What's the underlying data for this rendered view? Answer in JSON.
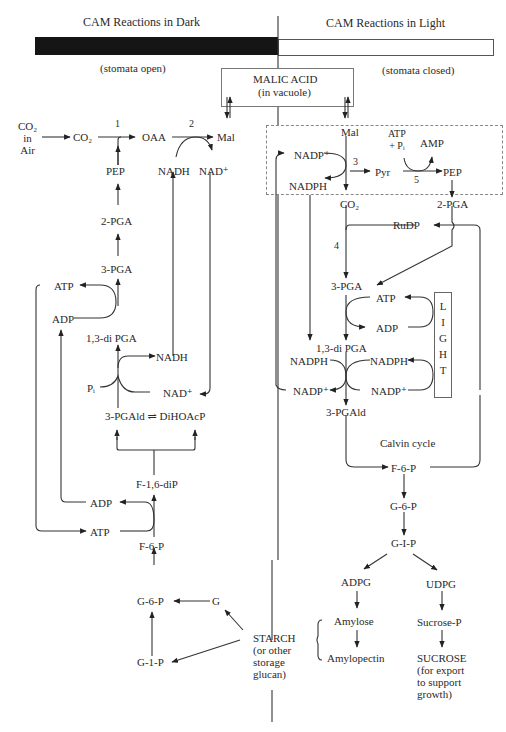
{
  "header": {
    "dark_title": "CAM Reactions in Dark",
    "light_title": "CAM Reactions in Light",
    "dark_note": "(stomata open)",
    "light_note": "(stomata closed)"
  },
  "vacuole": {
    "title": "MALIC ACID",
    "subtitle": "(in vacuole)"
  },
  "dark_pathway": {
    "co2_air": "CO₂\nin\nAir",
    "co2": "CO₂",
    "oaa": "OAA",
    "mal": "Mal",
    "step1": "1",
    "step2": "2",
    "pep": "PEP",
    "nadh_top": "NADH",
    "nad_top": "NAD⁺",
    "pga2": "2-PGA",
    "pga3": "3-PGA",
    "atp_upper": "ATP",
    "adp_upper": "ADP",
    "dipga": "1,3-di PGA",
    "nadh_mid": "NADH",
    "pi": "Pᵢ",
    "nad_mid": "NAD⁺",
    "pgald_eq": "3-PGAld ⇌ DiHOAcP",
    "f16dip": "F-1,6-diP",
    "adp_lower": "ADP",
    "atp_lower": "ATP",
    "f6p": "F-6-P",
    "g6p": "G-6-P",
    "g": "G",
    "g1p": "G-1-P",
    "starch": "STARCH\n(or other\nstorage\nglucan)"
  },
  "light_pathway": {
    "mal": "Mal",
    "atp_pi": "ATP\n+ Pᵢ",
    "amp": "AMP",
    "nadp_top": "NADP⁺",
    "nadph_top": "NADPH",
    "step3": "3",
    "pyr": "Pyr",
    "step5": "5",
    "pep": "PEP",
    "co2": "CO₂",
    "pga2": "2-PGA",
    "rudp": "RuDP",
    "step4": "4",
    "pga3": "3-PGA",
    "atp": "ATP",
    "adp": "ADP",
    "dipga": "1,3-di PGA",
    "nadph_left": "NADPH",
    "nadph_right": "NADPH",
    "nadp_left": "NADP⁺",
    "nadp_right": "NADP⁺",
    "light": "L\nI\nG\nH\nT",
    "pgald": "3-PGAld",
    "calvin": "Calvin cycle",
    "f6p": "F-6-P",
    "g6p": "G-6-P",
    "g1p": "G-I-P",
    "adpg": "ADPG",
    "udpg": "UDPG",
    "amylose": "Amylose",
    "amylopectin": "Amylopectin",
    "sucrose_p": "Sucrose-P",
    "sucrose": "SUCROSE\n(for export\nto support\ngrowth)"
  }
}
